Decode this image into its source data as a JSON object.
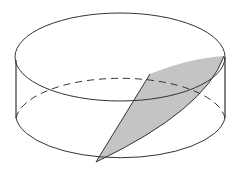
{
  "diagram": {
    "type": "geometry",
    "colors": {
      "stroke": "#333333",
      "shade": "#c4c4c4",
      "background": "#ffffff"
    },
    "cylinder": {
      "center_x": 120,
      "top_center_y": 57,
      "bottom_center_y": 118,
      "radius_x": 105,
      "radius_y": 44
    },
    "shaded_region": {
      "apex": [
        96,
        162
      ],
      "back_point": [
        150,
        73
      ],
      "rim_point": [
        224,
        56
      ]
    }
  }
}
